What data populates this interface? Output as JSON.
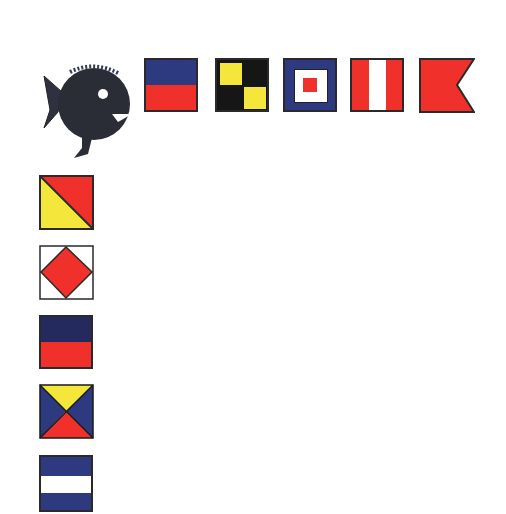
{
  "colors": {
    "navy": "#2e3a80",
    "red": "#f0302a",
    "yellow": "#f4e63a",
    "black": "#161616",
    "white": "#ffffff",
    "fish": "#2a2c36"
  },
  "fish": {
    "icon": "pufferfish-icon",
    "position": [
      40,
      62
    ]
  },
  "top_row": [
    {
      "letter": "E",
      "design": "navy-over-red horizontal halves",
      "x": 144,
      "y": 58
    },
    {
      "letter": "L",
      "design": "yellow-black quartered checker",
      "x": 215,
      "y": 58
    },
    {
      "letter": "W",
      "design": "navy border, white square, red center",
      "x": 283,
      "y": 58
    },
    {
      "letter": "I-variant",
      "design": "red-white-red vertical stripes",
      "x": 350,
      "y": 58
    },
    {
      "letter": "B",
      "design": "red swallowtail",
      "x": 419,
      "y": 58
    }
  ],
  "left_column": [
    {
      "letter": "O",
      "design": "red over yellow diagonal",
      "x": 39,
      "y": 175
    },
    {
      "letter": "F",
      "design": "red diamond on white",
      "x": 39,
      "y": 245
    },
    {
      "letter": "E",
      "design": "navy-over-red horizontal halves",
      "x": 39,
      "y": 315
    },
    {
      "letter": "Z",
      "design": "four triangles yellow/navy/red/navy",
      "x": 39,
      "y": 384
    },
    {
      "letter": "J",
      "design": "navy-white-navy horizontal stripes",
      "x": 39,
      "y": 455
    }
  ]
}
